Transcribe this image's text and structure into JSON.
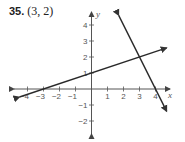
{
  "problem": {
    "number": "35.",
    "answer": "(3, 2)"
  },
  "chart_data": {
    "type": "line",
    "title": "",
    "xlabel": "x",
    "ylabel": "y",
    "xlim": [
      -4.5,
      5
    ],
    "ylim": [
      -2.5,
      5
    ],
    "x_ticks": [
      -4,
      -3,
      -2,
      -1,
      1,
      2,
      3,
      4
    ],
    "y_ticks": [
      -2,
      -1,
      1,
      2,
      3,
      4
    ],
    "grid": false,
    "series": [
      {
        "name": "line 1",
        "equation": "y = (1/3)x + 1",
        "points": [
          [
            -4.5,
            -0.5
          ],
          [
            -3,
            0
          ],
          [
            0,
            1
          ],
          [
            3,
            2
          ],
          [
            4.7,
            2.57
          ]
        ]
      },
      {
        "name": "line 2",
        "equation": "y = -2x + 8",
        "points": [
          [
            1.7,
            4.6
          ],
          [
            3,
            2
          ],
          [
            4,
            0
          ],
          [
            4.7,
            -1.4
          ]
        ]
      }
    ],
    "intersection": [
      3,
      2
    ],
    "annotations": [
      "(3, 2)"
    ]
  }
}
